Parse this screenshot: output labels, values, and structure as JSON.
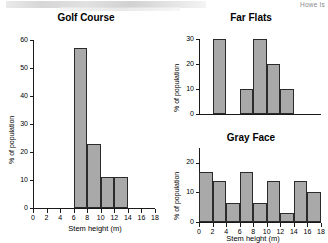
{
  "page": {
    "corner_note": "Howe Is"
  },
  "chart_data": [
    {
      "type": "bar",
      "title": "Golf Course",
      "xlabel": "Stem height (m)",
      "ylabel": "% of population",
      "xlim": [
        0,
        18
      ],
      "ylim": [
        0,
        60
      ],
      "xticks": [
        0,
        2,
        4,
        6,
        8,
        10,
        12,
        14,
        16,
        18
      ],
      "yticks": [
        0,
        10,
        20,
        30,
        40,
        50,
        60
      ],
      "bin_width": 2,
      "grid": false,
      "bins": [
        {
          "x0": 0,
          "x1": 2,
          "value": 0
        },
        {
          "x0": 2,
          "x1": 4,
          "value": 0
        },
        {
          "x0": 4,
          "x1": 6,
          "value": 0
        },
        {
          "x0": 6,
          "x1": 8,
          "value": 57
        },
        {
          "x0": 8,
          "x1": 10,
          "value": 23
        },
        {
          "x0": 10,
          "x1": 12,
          "value": 11
        },
        {
          "x0": 12,
          "x1": 14,
          "value": 11
        },
        {
          "x0": 14,
          "x1": 16,
          "value": 0
        },
        {
          "x0": 16,
          "x1": 18,
          "value": 0
        }
      ]
    },
    {
      "type": "bar",
      "title": "Far Flats",
      "xlabel": "",
      "ylabel": "% of population",
      "xlim": [
        0,
        18
      ],
      "ylim": [
        0,
        30
      ],
      "xticks": [],
      "yticks": [
        0,
        10,
        20,
        30
      ],
      "bin_width": 2,
      "grid": false,
      "bins": [
        {
          "x0": 0,
          "x1": 2,
          "value": 0
        },
        {
          "x0": 2,
          "x1": 4,
          "value": 30
        },
        {
          "x0": 4,
          "x1": 6,
          "value": 0
        },
        {
          "x0": 6,
          "x1": 8,
          "value": 10
        },
        {
          "x0": 8,
          "x1": 10,
          "value": 30
        },
        {
          "x0": 10,
          "x1": 12,
          "value": 20
        },
        {
          "x0": 12,
          "x1": 14,
          "value": 10
        },
        {
          "x0": 14,
          "x1": 16,
          "value": 0
        },
        {
          "x0": 16,
          "x1": 18,
          "value": 0
        }
      ]
    },
    {
      "type": "bar",
      "title": "Gray Face",
      "xlabel": "Stem height (m)",
      "ylabel": "% of population",
      "xlim": [
        0,
        18
      ],
      "ylim": [
        0,
        25
      ],
      "xticks": [
        0,
        2,
        4,
        6,
        8,
        10,
        12,
        14,
        16,
        18
      ],
      "yticks": [
        0,
        10,
        20
      ],
      "bin_width": 2,
      "grid": false,
      "bins": [
        {
          "x0": 0,
          "x1": 2,
          "value": 17
        },
        {
          "x0": 2,
          "x1": 4,
          "value": 14
        },
        {
          "x0": 4,
          "x1": 6,
          "value": 6.5
        },
        {
          "x0": 6,
          "x1": 8,
          "value": 17
        },
        {
          "x0": 8,
          "x1": 10,
          "value": 6.5
        },
        {
          "x0": 10,
          "x1": 12,
          "value": 14
        },
        {
          "x0": 12,
          "x1": 14,
          "value": 3
        },
        {
          "x0": 14,
          "x1": 16,
          "value": 14
        },
        {
          "x0": 16,
          "x1": 18,
          "value": 10
        }
      ]
    }
  ],
  "colors": {
    "bar_fill": "#a9a9a9",
    "bar_stroke": "#2b2b2b",
    "axis": "#1a1a1a",
    "text": "#000000"
  }
}
